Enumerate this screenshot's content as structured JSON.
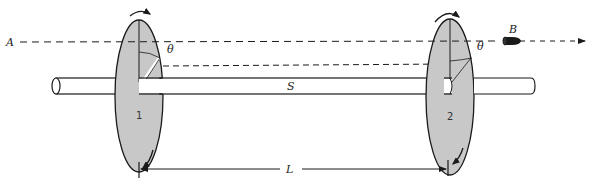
{
  "diagram": {
    "type": "physics-apparatus",
    "labels": {
      "line_start": "A",
      "projectile": "B",
      "shaft": "S",
      "angle_disc1": "θ",
      "angle_disc2": "θ",
      "disc1": "1",
      "disc2": "2",
      "separation": "L"
    },
    "colors": {
      "disc_fill": "#c8c8c8",
      "stroke": "#1a1a1a",
      "background": "#ffffff"
    }
  }
}
